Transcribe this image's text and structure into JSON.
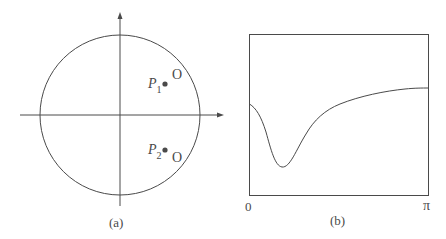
{
  "panel_a": {
    "caption": "(a)",
    "points": [
      {
        "name": "P",
        "subscript": "1",
        "marker": "O"
      },
      {
        "name": "P",
        "subscript": "2",
        "marker": "O"
      }
    ]
  },
  "panel_b": {
    "caption": "(b)",
    "x_tick_left": "0",
    "x_tick_right": "π"
  },
  "colors": {
    "line": "#4a4a4a",
    "background": "#ffffff"
  }
}
